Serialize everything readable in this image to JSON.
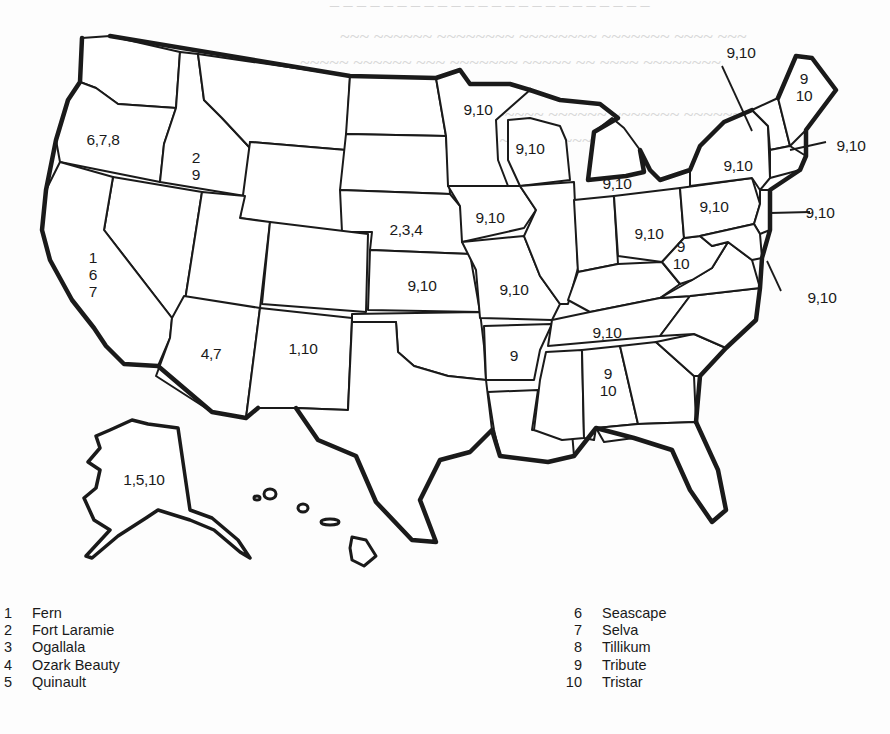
{
  "map": {
    "title": "",
    "region_labels": [
      {
        "id": "WA_OR",
        "state": "Oregon",
        "text": "6,7,8",
        "x": 103,
        "y": 139
      },
      {
        "id": "ID",
        "state": "Idaho",
        "text": "2\n9",
        "x": 196,
        "y": 166
      },
      {
        "id": "CA",
        "state": "California",
        "text": "1\n6\n7",
        "x": 93,
        "y": 274
      },
      {
        "id": "NE",
        "state": "Nebraska",
        "text": "2,3,4",
        "x": 406,
        "y": 229
      },
      {
        "id": "KS",
        "state": "Kansas",
        "text": "9,10",
        "x": 422,
        "y": 285
      },
      {
        "id": "AZ",
        "state": "Arizona",
        "text": "4,7",
        "x": 211,
        "y": 353
      },
      {
        "id": "NM",
        "state": "New Mexico",
        "text": "1,10",
        "x": 303,
        "y": 348
      },
      {
        "id": "AK",
        "state": "Alaska",
        "text": "1,5,10",
        "x": 144,
        "y": 479
      },
      {
        "id": "MN",
        "state": "Minnesota",
        "text": "9,10",
        "x": 478,
        "y": 109
      },
      {
        "id": "WI",
        "state": "Wisconsin",
        "text": "9,10",
        "x": 530,
        "y": 148
      },
      {
        "id": "MI",
        "state": "Michigan",
        "text": "9,10",
        "x": 617,
        "y": 183
      },
      {
        "id": "IA",
        "state": "Iowa",
        "text": "9,10",
        "x": 490,
        "y": 217
      },
      {
        "id": "MO",
        "state": "Missouri",
        "text": "9,10",
        "x": 514,
        "y": 289
      },
      {
        "id": "OH",
        "state": "Ohio",
        "text": "9,10",
        "x": 649,
        "y": 233
      },
      {
        "id": "WV",
        "state": "West Virginia",
        "text": "9\n10",
        "x": 681,
        "y": 255
      },
      {
        "id": "NY",
        "state": "New York",
        "text": "9,10",
        "x": 738,
        "y": 165
      },
      {
        "id": "PA",
        "state": "Pennsylvania",
        "text": "9,10",
        "x": 714,
        "y": 206
      },
      {
        "id": "ME",
        "state": "Maine",
        "text": "9\n10",
        "x": 804,
        "y": 87
      },
      {
        "id": "AR",
        "state": "Arkansas",
        "text": "9",
        "x": 514,
        "y": 355
      },
      {
        "id": "TN",
        "state": "Tennessee",
        "text": "9,10",
        "x": 607,
        "y": 332
      },
      {
        "id": "AL",
        "state": "Alabama",
        "text": "9\n10",
        "x": 608,
        "y": 382
      }
    ],
    "callouts": [
      {
        "id": "VT_NH",
        "text": "9,10",
        "x": 741,
        "y": 52,
        "line": [
          722,
          66,
          752,
          131
        ]
      },
      {
        "id": "MA_RI_CT",
        "text": "9,10",
        "x": 851,
        "y": 145,
        "line": [
          790,
          150,
          826,
          142
        ]
      },
      {
        "id": "NJ",
        "text": "9,10",
        "x": 820,
        "y": 212,
        "line": [
          770,
          215,
          810,
          212
        ]
      },
      {
        "id": "MD_DE",
        "text": "9,10",
        "x": 822,
        "y": 297,
        "line": [
          767,
          261,
          781,
          291
        ]
      }
    ]
  },
  "legend": {
    "left": [
      {
        "num": "1",
        "name": "Fern"
      },
      {
        "num": "2",
        "name": "Fort Laramie"
      },
      {
        "num": "3",
        "name": "Ogallala"
      },
      {
        "num": "4",
        "name": "Ozark Beauty"
      },
      {
        "num": "5",
        "name": "Quinault"
      }
    ],
    "right": [
      {
        "num": "6",
        "name": "Seascape"
      },
      {
        "num": "7",
        "name": "Selva"
      },
      {
        "num": "8",
        "name": "Tillikum"
      },
      {
        "num": "9",
        "name": "Tribute"
      },
      {
        "num": "10",
        "name": "Tristar"
      }
    ]
  }
}
